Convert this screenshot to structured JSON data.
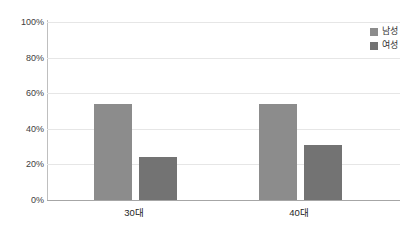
{
  "chart_data": {
    "type": "bar",
    "title": "",
    "subtitle": "",
    "xlabel": "",
    "ylabel": "",
    "categories": [
      "30대",
      "40대"
    ],
    "series": [
      {
        "name": "남성",
        "values": [
          54,
          54
        ],
        "color": "#8c8c8c"
      },
      {
        "name": "여성",
        "values": [
          24,
          31
        ],
        "color": "#737373"
      }
    ],
    "ylim": [
      0,
      100
    ],
    "ytick_labels": [
      "0%",
      "20%",
      "40%",
      "60%",
      "80%",
      "100%"
    ],
    "ytick_values": [
      0,
      20,
      40,
      60,
      80,
      100
    ],
    "grid": true,
    "legend_position": "top-right",
    "annotations": []
  },
  "axis": {
    "y": {
      "t100": "100%",
      "t80": "80%",
      "t60": "60%",
      "t40": "40%",
      "t20": "20%",
      "t0": "0%"
    },
    "x": {
      "cat0": "30대",
      "cat1": "40대"
    }
  },
  "legend": {
    "items": [
      {
        "label": "남성"
      },
      {
        "label": "여성"
      }
    ]
  },
  "colors": {
    "male_bar": "#8c8c8c",
    "female_bar": "#737373",
    "gridline": "#e6e6e6",
    "axis": "#a6a6a6",
    "background": "#ffffff",
    "tick_text": "#404040"
  }
}
